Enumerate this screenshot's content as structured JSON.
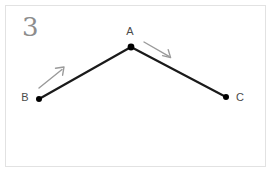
{
  "figure": {
    "number_label": "3",
    "frame_color": "#e2e2e2",
    "background_color": "#ffffff"
  },
  "diagram": {
    "path_color": "#1a1a1a",
    "path_stroke_width": 2.2,
    "vertex_color": "#000000",
    "arrow_color": "#9a9a9a",
    "label_color": "#4a4a4a",
    "points": [
      {
        "id": "A",
        "label": "A",
        "x": 131,
        "y": 47,
        "label_x": 130,
        "label_y": 35,
        "dot_radius": 3.4
      },
      {
        "id": "B",
        "label": "B",
        "x": 39,
        "y": 99,
        "label_x": 25,
        "label_y": 101,
        "dot_radius": 3.0
      },
      {
        "id": "C",
        "label": "C",
        "x": 226,
        "y": 97,
        "label_x": 240,
        "label_y": 101,
        "dot_radius": 3.0
      }
    ],
    "segments": [
      {
        "id": "segment-BA",
        "from": "B",
        "to": "A"
      },
      {
        "id": "segment-AC",
        "from": "A",
        "to": "C"
      }
    ],
    "arrows": [
      {
        "id": "arrow-BA",
        "description": "direction-arrow-from-B-toward-A",
        "x1": 39,
        "y1": 88,
        "x2": 64,
        "y2": 68
      },
      {
        "id": "arrow-AC",
        "description": "direction-arrow-from-A-toward-C",
        "x1": 144,
        "y1": 42,
        "x2": 171,
        "y2": 58
      }
    ]
  }
}
